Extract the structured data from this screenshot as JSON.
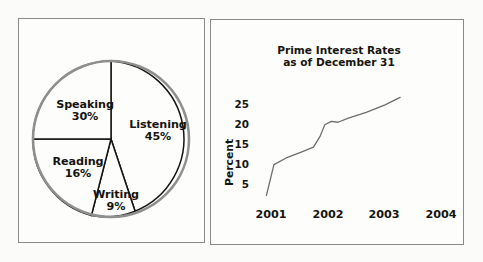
{
  "page": {
    "background_color": "#fbfbfa",
    "panel_border_color": "#8a8a8a",
    "ink_color": "#16140f"
  },
  "panels": [
    {
      "name": "pie-panel",
      "title": ""
    },
    {
      "name": "line-panel",
      "title": "Prime Interest Rates as of December 31"
    }
  ],
  "chart_data": [
    {
      "type": "pie",
      "title": "",
      "categories": [
        "Listening",
        "Writing",
        "Reading",
        "Speaking"
      ],
      "values": [
        45,
        9,
        16,
        30
      ],
      "value_labels": [
        "45%",
        "9%",
        "16%",
        "30%"
      ],
      "unit": "%",
      "start_angle_deg": 0,
      "direction": "clockwise",
      "slice_fill": "#fdfdfc",
      "outline_color": "#8f8f8f",
      "divider_color": "#16140f",
      "legend": "none",
      "labels_inline": true
    },
    {
      "type": "line",
      "title_line1": "Prime Interest Rates",
      "title_line2": "as of December 31",
      "xlabel": "",
      "ylabel": "Percent",
      "ytick_labels": [
        "25",
        "20",
        "15",
        "10",
        "5"
      ],
      "ytick_values": [
        25,
        20,
        15,
        10,
        5
      ],
      "ylim": [
        2,
        28
      ],
      "xtick_labels": [
        "2001",
        "2002",
        "2003",
        "2004"
      ],
      "xtick_values": [
        2001,
        2002,
        2003,
        2004
      ],
      "xlim": [
        2000.85,
        2004.1
      ],
      "grid": false,
      "legend": "none",
      "line_color": "#6d6d6d",
      "series": [
        {
          "name": "Prime Interest Rate",
          "x": [
            2000.88,
            2001.04,
            2001.3,
            2001.62,
            2001.88,
            2002.02,
            2002.12,
            2002.26,
            2002.4,
            2002.62,
            2003.0,
            2003.4,
            2003.72
          ],
          "values": [
            3.6,
            11.0,
            12.6,
            14.0,
            15.2,
            17.8,
            20.6,
            21.4,
            21.2,
            22.2,
            23.6,
            25.4,
            27.2
          ]
        }
      ]
    }
  ],
  "pie_labels": [
    {
      "name": "Speaking",
      "pct": "30%"
    },
    {
      "name": "Listening",
      "pct": "45%"
    },
    {
      "name": "Reading",
      "pct": "16%"
    },
    {
      "name": "Writing",
      "pct": "9%"
    }
  ],
  "line_axis": {
    "yticks": [
      "25",
      "20",
      "15",
      "10",
      "5"
    ],
    "xticks": [
      "2001",
      "2002",
      "2003",
      "2004"
    ],
    "ylabel": "Percent"
  }
}
